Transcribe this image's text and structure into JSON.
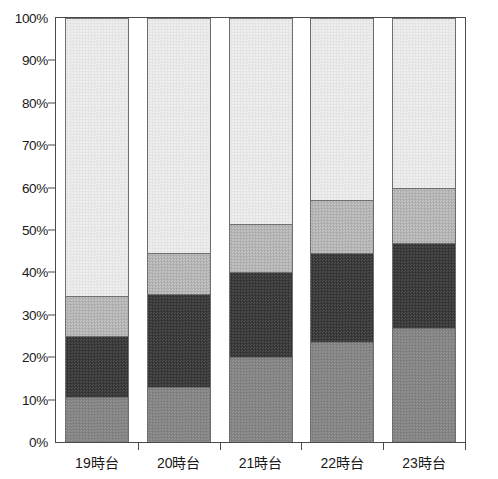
{
  "chart_data": {
    "type": "bar",
    "stacked": true,
    "normalized": "100%",
    "title": "",
    "subtitle": "",
    "xlabel": "",
    "ylabel": "",
    "categories": [
      "19時台",
      "20時台",
      "21時台",
      "22時台",
      "23時台"
    ],
    "ylim": [
      0,
      100
    ],
    "ytick_labels": [
      "0%",
      "10%",
      "20%",
      "30%",
      "40%",
      "50%",
      "60%",
      "70%",
      "80%",
      "90%",
      "100%"
    ],
    "ytick_values": [
      0,
      10,
      20,
      30,
      40,
      50,
      60,
      70,
      80,
      90,
      100
    ],
    "grid": false,
    "legend": "none",
    "series": [
      {
        "name": "series-1",
        "color": "#858585",
        "values": [
          10.5,
          13.0,
          20.0,
          23.5,
          27.0
        ],
        "cumulative_top": [
          10.5,
          13.0,
          20.0,
          23.5,
          27.0
        ]
      },
      {
        "name": "series-2",
        "color": "#3b3b3b",
        "values": [
          14.5,
          22.0,
          20.0,
          21.0,
          20.0
        ],
        "cumulative_top": [
          25.0,
          35.0,
          40.0,
          44.5,
          47.0
        ]
      },
      {
        "name": "series-3",
        "color": "#b4b4b4",
        "values": [
          9.5,
          9.5,
          11.5,
          12.5,
          13.0
        ],
        "cumulative_top": [
          34.5,
          44.5,
          51.5,
          57.0,
          60.0
        ]
      },
      {
        "name": "series-4",
        "color": "#e9e9e9",
        "values": [
          65.5,
          55.5,
          48.5,
          43.0,
          40.0
        ],
        "cumulative_top": [
          100.0,
          100.0,
          100.0,
          100.0,
          100.0
        ]
      }
    ]
  },
  "axis": {
    "y_ticks": [
      {
        "label": "100%",
        "value": 100
      },
      {
        "label": "90%",
        "value": 90
      },
      {
        "label": "80%",
        "value": 80
      },
      {
        "label": "70%",
        "value": 70
      },
      {
        "label": "60%",
        "value": 60
      },
      {
        "label": "50%",
        "value": 50
      },
      {
        "label": "40%",
        "value": 40
      },
      {
        "label": "30%",
        "value": 30
      },
      {
        "label": "20%",
        "value": 20
      },
      {
        "label": "10%",
        "value": 10
      },
      {
        "label": "0%",
        "value": 0
      }
    ]
  },
  "colors": {
    "axis": "#4a4a4a",
    "text": "#1a1a1a",
    "background": "#ffffff",
    "segment_border": "#6e6e6e"
  }
}
